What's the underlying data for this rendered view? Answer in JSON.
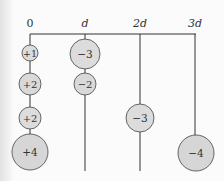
{
  "colors": {
    "line": "#333333",
    "circle_fill": "#d9d9d9",
    "circle_stroke": "#444444",
    "background": "#fbfbfb"
  },
  "axis": {
    "labels": [
      "0",
      "d",
      "2d",
      "3d"
    ]
  },
  "columns": [
    {
      "position_label": "0",
      "charges": [
        {
          "label": "+1"
        },
        {
          "label": "+2"
        },
        {
          "label": "+2"
        },
        {
          "label": "+4"
        }
      ]
    },
    {
      "position_label": "d",
      "charges": [
        {
          "label": "−3"
        },
        {
          "label": "−2"
        }
      ]
    },
    {
      "position_label": "2d",
      "charges": [
        {
          "label": "−3"
        }
      ]
    },
    {
      "position_label": "3d",
      "charges": [
        {
          "label": "−4"
        }
      ]
    }
  ]
}
